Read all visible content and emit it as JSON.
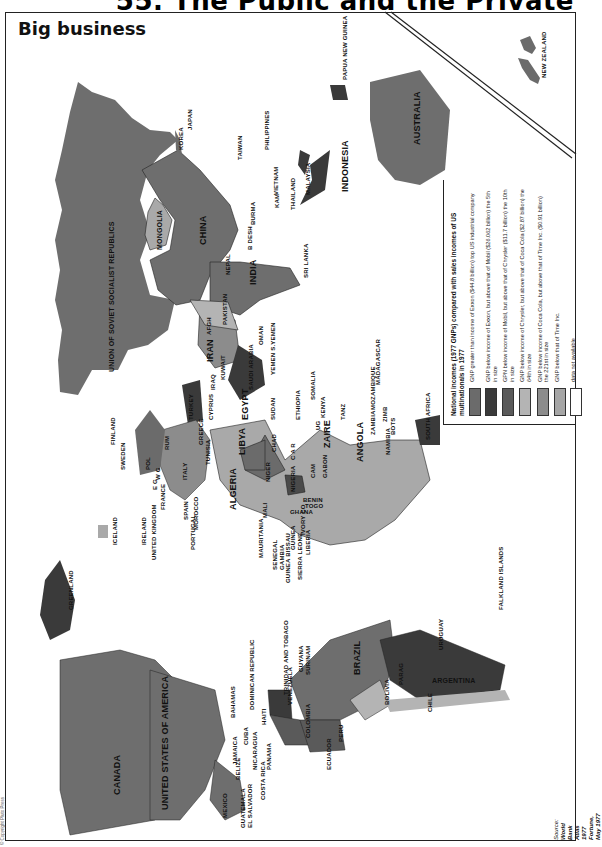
{
  "page": {
    "header_title": "55. The Public and the Private",
    "map_title": "Big business"
  },
  "legend": {
    "title": "National incomes (1977 GNPs) compared with sales incomes of US multinationals in 1977",
    "items": [
      {
        "label": "GNP greater than income of Exxon ($44.8 billion) top US industrial company",
        "color": "#6b6b6b"
      },
      {
        "label": "GNP below income of Exxon, but above that of Mobil ($26.062 billion) the 5th in size",
        "color": "#3a3a3a"
      },
      {
        "label": "GPN below income of Mobil, but above that of Chrysler ($11.7 billion) the 10th in size",
        "color": "#5a5a5a"
      },
      {
        "label": "GNP below income of Chrysler, but above that of Coca Cola ($2.87 billion) the 64th in size",
        "color": "#b4b4b4"
      },
      {
        "label": "GNP below income of Coca Cola, but above that of Time Inc. ($0.91 billion) the 221st in size",
        "color": "#8c8c8c"
      },
      {
        "label": "GNP below that of Time Inc.",
        "color": "#a6a6a6"
      },
      {
        "label": "data not available",
        "color": "#ffffff"
      }
    ]
  },
  "source": {
    "label": "Source:",
    "line1": "World Bank Atlas 1977",
    "line2": "Fortune, May 1977"
  },
  "copyright": "© Copyright Pluto Press",
  "countries": {
    "ussr": "UNION OF SOVIET SOCIALIST REPUBLICS",
    "mongolia": "MONGOLIA",
    "china": "CHINA",
    "india": "INDIA",
    "bdesh": "B DESH",
    "nepal": "NEPAL",
    "burma": "BURMA",
    "sri_lanka": "SRI LANKA",
    "afgh": "AFGH",
    "pakistan": "PAKISTAN",
    "iran": "IRAN",
    "iraq": "IRAQ",
    "kuwait": "KUWAIT",
    "saudi": "SAUDI ARABIA",
    "oman": "OMAN",
    "yemen": "YEMEN S.YEMEN",
    "syria": "SY",
    "turkey": "TURKEY",
    "cyprus": "CYPRUS",
    "greece": "GREECE",
    "korea": "KOREA",
    "japan": "JAPAN",
    "taiwan": "TAIWAN",
    "philippines": "PHILIPPINES",
    "vietnam": "VIETNAM",
    "kam": "KAM",
    "thailand": "THAILAND",
    "malaysia": "MALAYSIA",
    "indonesia": "INDONESIA",
    "png": "PAPUA NEW GUINEA",
    "australia": "AUSTRALIA",
    "new_zealand": "NEW ZEALAND",
    "egypt": "EGYPT",
    "libya": "LIBYA",
    "tunisia": "TUNISIA",
    "algeria": "ALGERIA",
    "morocco": "MOROCCO",
    "sudan": "SUDAN",
    "chad": "CHAD",
    "niger": "NIGER",
    "nigeria": "NIGERIA",
    "mali": "MALI",
    "mauritania": "MAURITANIA",
    "senegal": "SENEGAL",
    "gambia": "GAMBIA",
    "guinea_bissau": "GUINEA BISSAU",
    "guinea": "GUINEA",
    "sierra_leone": "SIERRA LEONE",
    "liberia": "LIBERIA",
    "ivory": "IVORY CO",
    "ghana": "GHANA",
    "benin": "BENIN",
    "togo": "TOGO",
    "car": "C A R",
    "cam": "CAM",
    "gabon": "GABON",
    "congo": "CO",
    "zaire": "ZAIRE",
    "angola": "ANGOLA",
    "zambia": "ZAMBIA",
    "zimb": "ZIMB",
    "bots": "BOTS",
    "namibia": "NAMIBIA",
    "south_africa": "SOUTH AFRICA",
    "mozambique": "MOZAMBIQUE",
    "madagascar": "MADAGASCAR",
    "tanz": "TANZ",
    "kenya": "KENYA",
    "ug": "UG",
    "ethiopia": "ETHIOPIA",
    "somalia": "SOMALIA",
    "finland": "FINLAND",
    "sweden": "SWEDEN",
    "norway": "NORWAY",
    "pol": "POL",
    "ussr_eu": "RUM",
    "hun": "HUN",
    "bul": "BUL",
    "e_g": "E G",
    "w_g": "W G",
    "fr": "FRANCE",
    "italy": "ITALY",
    "spain": "SPAIN",
    "portugal": "PORTUGAL",
    "ireland": "IRELAND",
    "uk": "UNITED KINGDOM",
    "iceland": "ICELAND",
    "greenland": "GREENLAND",
    "canada": "CANADA",
    "usa": "UNITED STATES OF AMERICA",
    "mexico": "MEXICO",
    "guatemala": "GUATEMALA",
    "el_salvador": "EL SALVADOR",
    "belize": "BELIZE",
    "costa_rica": "COSTA RICA",
    "panama": "PANAMA",
    "nicaragua": "NICARAGUA",
    "cuba": "CUBA",
    "jamaica": "JAMAICA",
    "haiti": "HAITI",
    "bahamas": "BAHAMAS",
    "dominican": "DOMINICAN REPUBLIC",
    "trinidad": "TRINIDAD AND TOBAGO",
    "guyana": "GUYANA",
    "surinam": "SURINAM",
    "venezuela": "VENEZUELA",
    "colombia": "COLOMBIA",
    "ecuador": "ECUADOR",
    "peru": "PERU",
    "brazil": "BRAZIL",
    "bolivia": "BOLIVIA",
    "paraguay": "PARAG",
    "uruguay": "URUGUAY",
    "argentina": "ARGENTINA",
    "chile": "CHILE",
    "falkland": "FALKLAND ISLANDS"
  }
}
